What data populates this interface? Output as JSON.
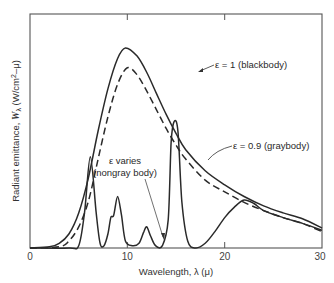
{
  "chart_data": {
    "type": "line",
    "title": "",
    "xlabel": "Wavelength, λ (μ)",
    "ylabel": "Radiant emittance, Wλ (W/cm²-μ)",
    "xlim": [
      0,
      30
    ],
    "ylim": [
      0,
      100
    ],
    "y_units_note": "relative (no y tick labels shown)",
    "x_ticks": [
      0,
      10,
      20,
      30
    ],
    "grid": false,
    "legend": "none (inline annotations)",
    "series": [
      {
        "name": "ε = 1 (blackbody)",
        "style": "solid",
        "x": [
          0,
          2,
          3,
          4,
          5,
          6,
          7,
          8,
          9,
          9.8,
          11,
          12,
          13,
          14,
          15,
          16,
          18,
          20,
          22,
          24,
          26,
          28,
          30
        ],
        "y": [
          0,
          0.5,
          2,
          6,
          15,
          30,
          50,
          68,
          81,
          85.5,
          82,
          75,
          66,
          57,
          49,
          42,
          33,
          27,
          22,
          18,
          15,
          12.5,
          8.5
        ]
      },
      {
        "name": "ε = 0.9 (graybody)",
        "style": "dashed",
        "x": [
          0,
          3,
          4,
          5,
          6,
          7,
          8,
          9,
          10,
          11,
          12,
          13,
          14,
          15,
          16,
          18,
          20,
          22,
          24,
          26,
          28,
          30
        ],
        "y": [
          0,
          0.5,
          3,
          9,
          20,
          38,
          56,
          70,
          77,
          74,
          67,
          59,
          51,
          44,
          38,
          29,
          24,
          19.5,
          16,
          13,
          10.5,
          7
        ]
      },
      {
        "name": "ε varies (nongray body)",
        "style": "solid",
        "x": [
          0,
          4,
          5,
          5.6,
          6.2,
          6.8,
          7.2,
          7.6,
          8.0,
          8.3,
          8.6,
          9.0,
          9.4,
          9.8,
          10.5,
          11.2,
          11.7,
          12.0,
          12.4,
          12.9,
          13.6,
          14.2,
          14.5,
          14.8,
          15.2,
          15.6,
          16.2,
          17.0,
          18.0,
          19.0,
          20.0,
          21.0,
          22.0,
          23.0,
          24.0,
          26.0,
          28.0,
          30.0
        ],
        "y": [
          0,
          0,
          1,
          15,
          39,
          15,
          2,
          1,
          6,
          13,
          14,
          22,
          14,
          3,
          1,
          2,
          7,
          9,
          5,
          1,
          1,
          12,
          45,
          54,
          50,
          20,
          3,
          0,
          2,
          7,
          13,
          17.5,
          20.5,
          19,
          16,
          13,
          10.5,
          7.5
        ]
      }
    ],
    "annotations": [
      {
        "text": "ε = 1 (blackbody)",
        "points_to": "blackbody curve near λ≈13"
      },
      {
        "text": "ε = 0.9 (graybody)",
        "points_to": "graybody curve near λ≈17"
      },
      {
        "text": "ε varies",
        "points_to": "nongray curve near λ≈14"
      },
      {
        "text": "(nongray body)",
        "points_to": ""
      }
    ]
  },
  "labels": {
    "x_axis": "Wavelength, λ (μ)",
    "y_axis_prefix": "Radiant emittance, ",
    "y_axis_symbol": "W",
    "y_axis_sub": "λ",
    "y_axis_units": " (W/cm",
    "y_axis_sup": "2",
    "y_axis_units_end": "–μ)",
    "tick_0": "0",
    "tick_10": "10",
    "tick_20": "20",
    "tick_30": "30",
    "ann_blackbody": "ε = 1 (blackbody)",
    "ann_graybody": "ε = 0.9 (graybody)",
    "ann_nongray_1": "ε varies",
    "ann_nongray_2": "(nongray body)"
  },
  "colors": {
    "line": "#2a2a2a",
    "frame": "#555555",
    "background": "#ffffff"
  }
}
